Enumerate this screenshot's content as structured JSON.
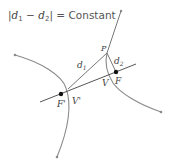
{
  "equation": {
    "text": "|d₁ − d₂| = Constant",
    "var1": "d",
    "sub1": "1",
    "minus": "−",
    "var2": "d",
    "sub2": "2",
    "rhs": "= Constant"
  },
  "labels": {
    "P": "P",
    "d1": "d",
    "d1_sub": "1",
    "d2": "d",
    "d2_sub": "2",
    "F": "F",
    "F_prime": "F'",
    "V": "V",
    "V_prime": "V'"
  },
  "colors": {
    "curve": "#8a8a8a",
    "line": "#555555",
    "point": "#111111",
    "text": "#444444"
  }
}
